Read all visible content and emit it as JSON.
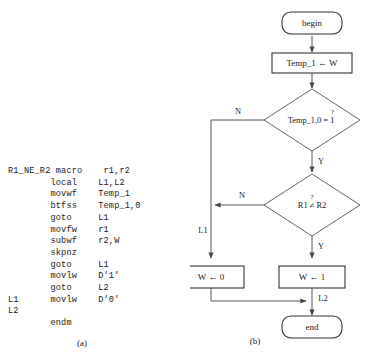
{
  "figure": {
    "caption_a": "(a)",
    "caption_b": "(b)"
  },
  "code": {
    "lines": [
      "R1_NE_R2 macro    r1,r2",
      "        local    L1,L2",
      "        movwf    Temp_1",
      "        btfss    Temp_1,0",
      "        goto     L1",
      "        movfw    r1",
      "        subwf    r2,W",
      "        skpnz",
      "        goto     L1",
      "        movlw    D'1'",
      "        goto     L2",
      "L1      movlw    D'0'",
      "L2",
      "        endm"
    ]
  },
  "flowchart": {
    "nodes": {
      "begin": "begin",
      "assign_temp": "Temp_1 ← W",
      "decision_bit": "Temp_1,0 = 1",
      "decision_bit_qmark": "?",
      "decision_cmp": "R1 ≠ R2",
      "decision_cmp_qmark": "?",
      "set_w_zero": "W ← 0",
      "set_w_one": "W ← 1",
      "end": "end"
    },
    "edge_labels": {
      "bit_no": "N",
      "bit_yes": "Y",
      "cmp_no": "N",
      "cmp_yes": "Y",
      "label_l1": "L1",
      "label_l2": "L2"
    }
  }
}
